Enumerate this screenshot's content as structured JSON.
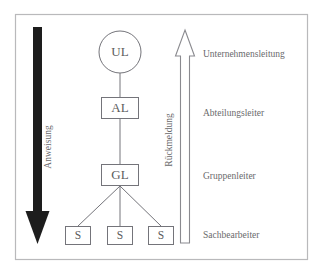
{
  "diagram": {
    "title_fragment": "",
    "frame": {
      "border_color": "#b9b9bb"
    },
    "nodes": [
      {
        "id": "ul",
        "label": "UL",
        "shape": "circle",
        "role_label": "Unternehmensleitung"
      },
      {
        "id": "al",
        "label": "AL",
        "shape": "rect",
        "role_label": "Abteilungsleiter"
      },
      {
        "id": "gl",
        "label": "GL",
        "shape": "rect",
        "role_label": "Gruppenleiter"
      },
      {
        "id": "s1",
        "label": "S",
        "shape": "rect",
        "role_label": "Sachbearbeiter"
      },
      {
        "id": "s2",
        "label": "S",
        "shape": "rect",
        "role_label": "Sachbearbeiter"
      },
      {
        "id": "s3",
        "label": "S",
        "shape": "rect",
        "role_label": "Sachbearbeiter"
      }
    ],
    "level_labels": [
      "Unternehmensleitung",
      "Abteilungsleiter",
      "Gruppenleiter",
      "Sachbearbeiter"
    ],
    "arrows": [
      {
        "id": "anweisung",
        "label": "Anweisung",
        "direction": "down",
        "style": "solid",
        "color": "#1d1d1d"
      },
      {
        "id": "rueckmeldung",
        "label": "Rückmeldung",
        "direction": "up",
        "style": "hollow",
        "color": "#8a8a8f"
      }
    ]
  }
}
